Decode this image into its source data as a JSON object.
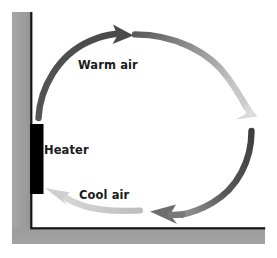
{
  "diagram": {
    "labels": {
      "warm_air": "Warm air",
      "heater": "Heater",
      "cool_air": "Cool air"
    },
    "colors": {
      "wall": "#9d9d9d",
      "wall_edge": "#1a1a1a",
      "floor": "#9d9d9d",
      "heater": "#000000",
      "arrow_dark": "#4a4a4a",
      "arrow_mid": "#8c8c8c",
      "arrow_light": "#d0d0d0",
      "text": "#1a1a1a",
      "background": "#ffffff"
    },
    "elements": [
      {
        "name": "wall",
        "kind": "vertical-wall",
        "x": 12,
        "y": 12,
        "width": 20,
        "height": 228
      },
      {
        "name": "floor",
        "kind": "horizontal-floor",
        "x": 12,
        "y": 228,
        "width": 253,
        "height": 16
      },
      {
        "name": "heater",
        "kind": "rectangle",
        "x": 30,
        "y": 124,
        "width": 13,
        "height": 70
      },
      {
        "name": "warm-air-arrow",
        "kind": "curved-arrow",
        "direction": "up-right",
        "shade": "dark"
      },
      {
        "name": "top-right-arc",
        "kind": "curved-arrow",
        "direction": "right-down",
        "shade": "mid-to-light"
      },
      {
        "name": "right-descending-arrow",
        "kind": "curved-arrow",
        "direction": "down",
        "shade": "light"
      },
      {
        "name": "right-lower-arc",
        "kind": "curved-arrow",
        "direction": "down-left",
        "shade": "dark"
      },
      {
        "name": "cool-air-arrow",
        "kind": "curved-arrow",
        "direction": "left",
        "shade": "light"
      }
    ]
  }
}
